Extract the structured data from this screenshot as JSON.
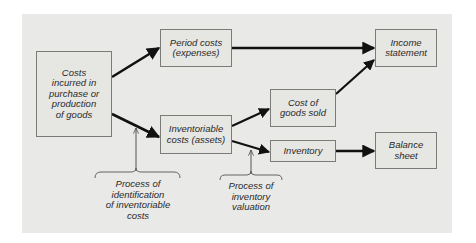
{
  "diagram": {
    "title": "",
    "nodes": {
      "costs_incurred": {
        "label": "Costs\nincurred in\npurchase or\nproduction\nof goods"
      },
      "period_costs": {
        "label": "Period costs\n(expenses)"
      },
      "inventoriable_costs": {
        "label": "Inventoriable\ncosts (assets)"
      },
      "cost_of_goods_sold": {
        "label": "Cost of\ngoods sold"
      },
      "inventory": {
        "label": "Inventory"
      },
      "income_statement": {
        "label": "Income\nstatement"
      },
      "balance_sheet": {
        "label": "Balance\nsheet"
      }
    },
    "edges": [
      {
        "from": "costs_incurred",
        "to": "period_costs"
      },
      {
        "from": "costs_incurred",
        "to": "inventoriable_costs"
      },
      {
        "from": "period_costs",
        "to": "income_statement"
      },
      {
        "from": "inventoriable_costs",
        "to": "cost_of_goods_sold"
      },
      {
        "from": "inventoriable_costs",
        "to": "inventory"
      },
      {
        "from": "cost_of_goods_sold",
        "to": "income_statement"
      },
      {
        "from": "inventory",
        "to": "balance_sheet"
      }
    ],
    "annotations": {
      "identification": {
        "label": "Process of\nidentification\nof inventoriable\ncosts"
      },
      "valuation": {
        "label": "Process of\ninventory\nvaluation"
      }
    }
  }
}
